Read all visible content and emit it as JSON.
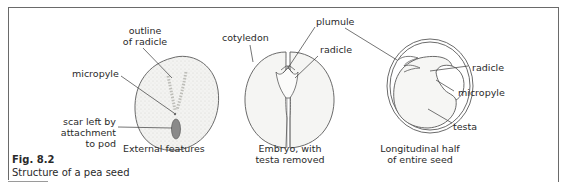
{
  "figure": {
    "number": "Fig. 8.2",
    "caption": "Structure of a pea seed"
  },
  "panels": [
    {
      "title_line1": "External features",
      "title_line2": "",
      "labels": {
        "outline_of_radicle_1": "outline",
        "outline_of_radicle_2": "of radicle",
        "micropyle": "micropyle",
        "scar_1": "scar left by",
        "scar_2": "attachment",
        "scar_3": "to pod"
      }
    },
    {
      "title_line1": "Embryo, with",
      "title_line2": "testa removed",
      "labels": {
        "cotyledon": "cotyledon",
        "plumule": "plumule",
        "radicle": "radicle"
      }
    },
    {
      "title_line1": "Longitudinal half",
      "title_line2": "of entire seed",
      "labels": {
        "radicle": "radicle",
        "micropyle": "micropyle",
        "testa": "testa"
      }
    }
  ],
  "colors": {
    "line": "#4a4a4a",
    "seed_fill": "#f1f1ef",
    "scar": "#8a8a8a"
  }
}
